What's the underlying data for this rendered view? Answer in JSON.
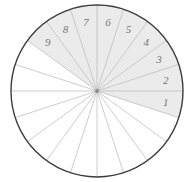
{
  "figure": {
    "name": "sector-circle-diagram",
    "background_color": "#ffffff"
  },
  "circle": {
    "center_x": 97,
    "center_y": 91,
    "radius": 86,
    "outline_color": "#3c3c3c",
    "outline_width": 1.4
  },
  "sectors": {
    "count": 20,
    "angle_degrees": 18,
    "spoke_color": "#b8b8b8",
    "spoke_width": 0.7,
    "shaded_fill": "#ebebeb",
    "unshaded_fill": "#ffffff"
  },
  "center_dot": {
    "color": "#8c8c8c",
    "radius": 2
  },
  "labels": {
    "color": "#77777a",
    "font_size": 11,
    "items": [
      {
        "text": "1",
        "angle": -9,
        "radius_fraction": 0.81
      },
      {
        "text": "2",
        "angle": 9,
        "radius_fraction": 0.81
      },
      {
        "text": "3",
        "angle": 27,
        "radius_fraction": 0.81
      },
      {
        "text": "4",
        "angle": 45,
        "radius_fraction": 0.81
      },
      {
        "text": "5",
        "angle": 63,
        "radius_fraction": 0.81
      },
      {
        "text": "6",
        "angle": 81,
        "radius_fraction": 0.81
      },
      {
        "text": "7",
        "angle": 99,
        "radius_fraction": 0.81
      },
      {
        "text": "8",
        "angle": 117,
        "radius_fraction": 0.81
      },
      {
        "text": "9",
        "angle": 135,
        "radius_fraction": 0.81
      }
    ]
  },
  "chart_data": {
    "type": "pie",
    "title": "",
    "xlabel": "",
    "ylabel": "",
    "total_sectors": 20,
    "sector_angle_degrees": 18,
    "shaded_sectors": 9,
    "unshaded_sectors": 11,
    "shaded_fraction": "9/20",
    "categories": [
      "1",
      "2",
      "3",
      "4",
      "5",
      "6",
      "7",
      "8",
      "9"
    ],
    "values": [
      18,
      18,
      18,
      18,
      18,
      18,
      18,
      18,
      18
    ],
    "legend": [],
    "annotations": [
      "Nine shaded sectors labeled 1 through 9 counterclockwise from just below the right horizontal radius"
    ],
    "grid": false
  }
}
